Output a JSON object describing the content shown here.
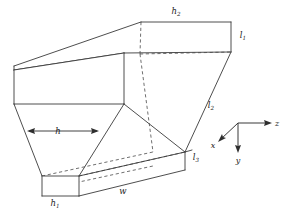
{
  "figure": {
    "background_color": "#ffffff",
    "line_color": "#3a3a3a",
    "hidden_line_color": "#4a4a4a",
    "text_color": "#1c1c1c"
  },
  "labels": {
    "h2": {
      "base": "h",
      "sub": "2",
      "x": 176,
      "y": 14
    },
    "l1": {
      "base": "l",
      "sub": "1",
      "x": 243,
      "y": 38
    },
    "l2": {
      "base": "l",
      "sub": "2",
      "x": 211,
      "y": 108
    },
    "l3": {
      "base": "l",
      "sub": "3",
      "x": 196,
      "y": 160
    },
    "h1": {
      "base": "h",
      "sub": "1",
      "x": 55,
      "y": 206
    },
    "h": {
      "base": "h",
      "sub": "",
      "x": 55,
      "y": 134
    },
    "w": {
      "base": "w",
      "sub": "",
      "x": 123,
      "y": 194
    }
  },
  "axes": {
    "origin": {
      "x": 238,
      "y": 123
    },
    "z": {
      "label": "z",
      "label_x": 276,
      "label_y": 126,
      "tip_x": 271,
      "tip_y": 123
    },
    "y": {
      "label": "y",
      "label_x": 237,
      "label_y": 161,
      "tip_x": 238,
      "tip_y": 152
    },
    "x": {
      "label": "x",
      "label_x": 212,
      "label_y": 147,
      "tip_x": 219,
      "tip_y": 140
    }
  },
  "dimension_arrow_h": {
    "left_x": 27,
    "right_x": 99,
    "y": 131
  },
  "geometry": {
    "top_face": "wide inlet opening at top, parallelogram in oblique projection",
    "bottom_box": "narrow outlet duct at bottom right",
    "left_face": "rectangular side panel with dashed diagonal",
    "taper": "converging walls from wide top to narrow bottom"
  }
}
